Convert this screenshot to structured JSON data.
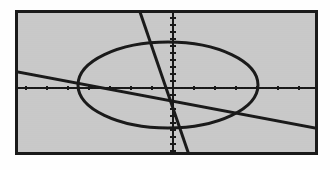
{
  "screen": {
    "kind": "graphing-calculator-graph-screen",
    "width": 330,
    "height": 170,
    "page_background": "#fefefe",
    "window_background": "#c9c9c9",
    "ink_color": "#1a1a1a",
    "frame_color": "#1a1a1a",
    "frame_thickness": 3,
    "frame_left": 15,
    "frame_top": 10,
    "frame_width": 303,
    "frame_height": 145
  },
  "axes": {
    "x_axis_label": "",
    "y_axis_label": "",
    "x_axis_pixel_y": 75,
    "y_axis_pixel_x": 155,
    "tick_marks_visible": true,
    "grid_visible": false,
    "x_tick_spacing_px": 21,
    "y_tick_spacing_px": 7,
    "x_tick_length_px": 4,
    "y_tick_length_px": 5,
    "axis_stroke_width": 2.2,
    "tick_stroke_width": 2.0
  },
  "chart_data": {
    "type": "scatter",
    "title": "",
    "subtitle": "",
    "xlabel": "",
    "ylabel": "",
    "grid": false,
    "legend_position": "none",
    "xlim": [
      -10,
      10
    ],
    "ylim": [
      -10,
      10
    ],
    "axis_tick_labels_visible": false,
    "series": [
      {
        "name": "ellipse",
        "kind": "ellipse",
        "stroke": "#1a1a1a",
        "stroke_width": 3.0,
        "center_px": [
          168,
          85
        ],
        "radius_x_px": 90,
        "radius_y_px": 43,
        "center_units": [
          0.4,
          0.7
        ],
        "semi_axis_x_units": 6.0,
        "semi_axis_y_units": 5.9,
        "note": "closed conic drawn as dotted/steppy pixel trace"
      },
      {
        "name": "line-negative-slope",
        "kind": "line",
        "stroke": "#1a1a1a",
        "stroke_width": 3.0,
        "p1_px": [
          18,
          72
        ],
        "p2_px": [
          315,
          128
        ],
        "slope_px": 0.188,
        "note": "descends left-to-right, crosses x-axis near right edge"
      },
      {
        "name": "line-positive-slope",
        "kind": "line",
        "stroke": "#1a1a1a",
        "stroke_width": 3.0,
        "p1_px": [
          188,
          152
        ],
        "p2_px": [
          140,
          12
        ],
        "slope_px": -2.92,
        "note": "steep ascending line exiting top edge and bottom edge"
      }
    ],
    "intersections_px": [
      [
        152,
        86
      ],
      [
        163,
        53
      ],
      [
        227,
        61
      ],
      [
        239,
        98
      ]
    ]
  },
  "annotations": {
    "visible_text_items": [],
    "cursor_visible": false,
    "status_bar_visible": false
  }
}
